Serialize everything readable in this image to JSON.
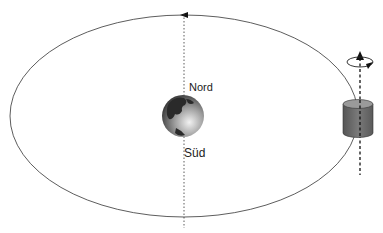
{
  "diagram": {
    "labels": {
      "north": "Nord",
      "south": "Süd"
    },
    "elements": {
      "orbit": "elliptical-orbit",
      "earth": "earth-globe",
      "satellite": "cylindrical-satellite",
      "earth_axis": "dotted-vertical-axis",
      "satellite_spin_axis": "dashed-arrow-axis-with-rotation"
    },
    "colors": {
      "line": "#333333",
      "satellite_body": "#6b6b6b",
      "satellite_top": "#9a9a9a",
      "background": "#ffffff"
    }
  }
}
